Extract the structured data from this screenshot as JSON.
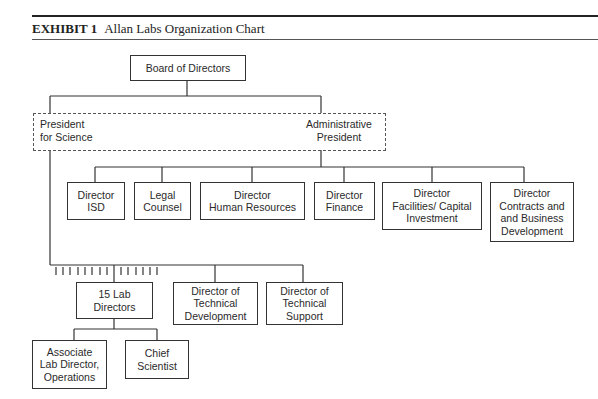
{
  "header": {
    "exhibit_label": "EXHIBIT 1",
    "title": "Allan Labs Organization Chart"
  },
  "chart": {
    "board": "Board of Directors",
    "presidency": {
      "science": "President\nfor Science",
      "admin": "Administrative\nPresident"
    },
    "admin_reports": [
      "Director\nISD",
      "Legal\nCounsel",
      "Director\nHuman Resources",
      "Director\nFinance",
      "Director\nFacilities/ Capital\nInvestment",
      "Director\nContracts and\nand Business\nDevelopment"
    ],
    "science_reports": [
      "15 Lab\nDirectors",
      "Director of\nTechnical\nDevelopment",
      "Director of\nTechnical\nSupport"
    ],
    "lab_reports": [
      "Associate\nLab Director,\nOperations",
      "Chief\nScientist"
    ],
    "lab_director_tick_count": 15
  }
}
